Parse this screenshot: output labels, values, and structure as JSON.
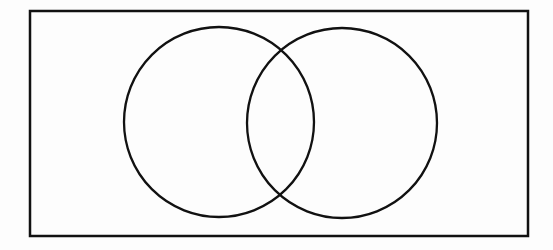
{
  "diagram": {
    "type": "venn",
    "sets": 2,
    "labels": [],
    "stroke_color": "#111111",
    "background": "#fdfdfd",
    "universe": {
      "x": 30,
      "y": 11,
      "width": 498,
      "height": 225
    },
    "circles": [
      {
        "name": "left-set",
        "cx": 219,
        "cy": 122,
        "r": 95
      },
      {
        "name": "right-set",
        "cx": 342,
        "cy": 123,
        "r": 95
      }
    ]
  }
}
